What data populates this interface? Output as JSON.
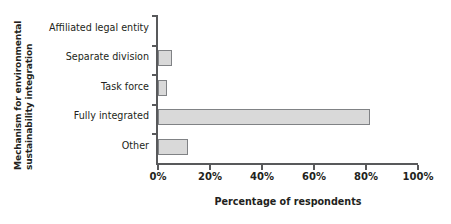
{
  "chart_data": {
    "type": "bar",
    "orientation": "horizontal",
    "title": "",
    "xlabel": "Percentage of respondents",
    "ylabel_line1": "Mechanism for environmental",
    "ylabel_line2": "sustainability integration",
    "categories": [
      "Affiliated legal entity",
      "Separate division",
      "Task force",
      "Fully integrated",
      "Other"
    ],
    "values": [
      0,
      5.4,
      3.5,
      81.5,
      11.5
    ],
    "value_unit": "%",
    "xlim": [
      0,
      100
    ],
    "xticks": [
      0,
      20,
      40,
      60,
      80,
      100
    ],
    "xtick_labels": [
      "0%",
      "20%",
      "40%",
      "60%",
      "80%",
      "100%"
    ],
    "grid": false,
    "legend": false,
    "bar_fill_color": "#d9d9d9",
    "bar_border_color": "#808285",
    "axis_color": "#58595b",
    "text_color": "#231f20",
    "background_color": "#ffffff"
  }
}
